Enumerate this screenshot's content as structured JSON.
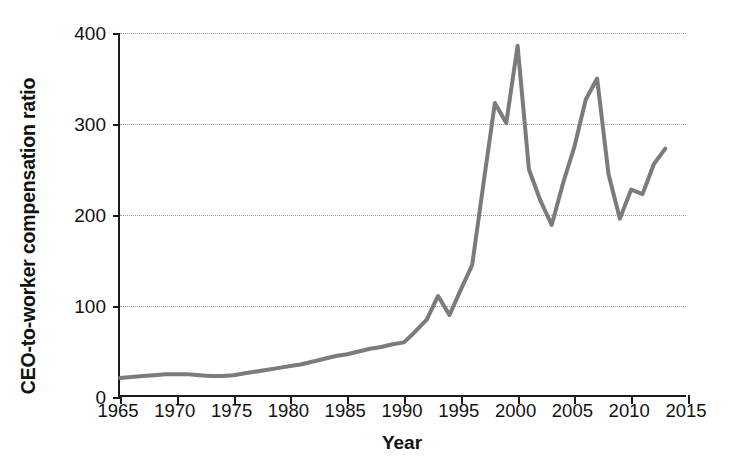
{
  "chart_data": {
    "type": "line",
    "title": "",
    "xlabel": "Year",
    "ylabel": "CEO-to-worker compensation ratio",
    "xlim": [
      1965,
      2015
    ],
    "ylim": [
      0,
      400
    ],
    "xticks": [
      1965,
      1970,
      1975,
      1980,
      1985,
      1990,
      1995,
      2000,
      2005,
      2010,
      2015
    ],
    "yticks": [
      0,
      100,
      200,
      300,
      400
    ],
    "grid": "horizontal-dotted",
    "legend": "none",
    "line_color": "#7b7b7b",
    "axis_color": "#1a1a1a",
    "series": [
      {
        "name": "CEO-to-worker compensation ratio",
        "x": [
          1965,
          1966,
          1967,
          1968,
          1969,
          1970,
          1971,
          1972,
          1973,
          1974,
          1975,
          1976,
          1977,
          1978,
          1979,
          1980,
          1981,
          1982,
          1983,
          1984,
          1985,
          1986,
          1987,
          1988,
          1989,
          1990,
          1991,
          1992,
          1993,
          1994,
          1995,
          1996,
          1997,
          1998,
          1999,
          2000,
          2001,
          2002,
          2003,
          2004,
          2005,
          2006,
          2007,
          2008,
          2009,
          2010,
          2011,
          2012,
          2013
        ],
        "values": [
          21,
          22,
          23,
          24,
          25,
          25,
          25,
          24,
          23,
          23,
          24,
          26,
          28,
          30,
          32,
          34,
          36,
          39,
          42,
          45,
          47,
          50,
          53,
          55,
          58,
          60,
          72,
          85,
          111,
          90,
          118,
          145,
          235,
          323,
          301,
          386,
          250,
          216,
          189,
          235,
          275,
          327,
          350,
          245,
          196,
          228,
          223,
          256,
          273
        ]
      }
    ]
  },
  "axes": {
    "y_title": "CEO-to-worker compensation ratio",
    "x_title": "Year",
    "y_tick_labels": [
      "0",
      "100",
      "200",
      "300",
      "400"
    ],
    "x_tick_labels": [
      "1965",
      "1970",
      "1975",
      "1980",
      "1985",
      "1990",
      "1995",
      "2000",
      "2005",
      "2010",
      "2015"
    ]
  }
}
